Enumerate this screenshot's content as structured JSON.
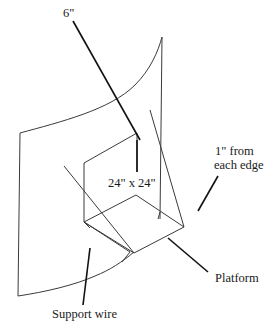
{
  "diagram": {
    "type": "technical-illustration",
    "labels": {
      "six_inch": "6\"",
      "one_inch_line1": "1\" from",
      "one_inch_line2": "each edge",
      "square_size": "24\" x 24\"",
      "platform": "Platform",
      "support_wire": "Support wire"
    },
    "colors": {
      "background": "#ffffff",
      "line": "#3a3a3a",
      "leader": "#111111",
      "text": "#1a1a1a"
    }
  }
}
